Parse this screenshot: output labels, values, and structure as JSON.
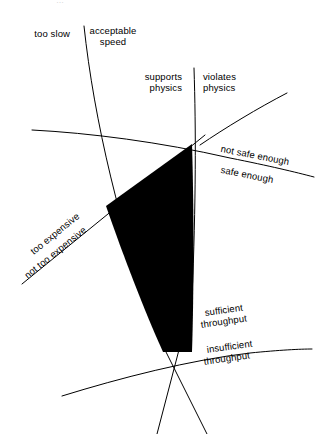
{
  "figure": {
    "kind": "constraint-boundary-diagram",
    "background_color": "#ffffff",
    "line_color": "#000000",
    "region_fill_color": "#000000",
    "top_fragment_text": "…"
  },
  "labels": {
    "too_slow": "too slow",
    "acceptable_speed_line1": "acceptable",
    "acceptable_speed_line2": "speed",
    "supports_physics_line1": "supports",
    "supports_physics_line2": "physics",
    "violates_physics_line1": "violates",
    "violates_physics_line2": "physics",
    "not_safe_enough": "not safe enough",
    "safe_enough": "safe enough",
    "too_expensive": "too expensive",
    "not_too_expensive": "not too expensive",
    "sufficient_throughput_line1": "sufficient",
    "sufficient_throughput_line2": "throughput",
    "insufficient_throughput_line1": "insufficient",
    "insufficient_throughput_line2": "throughput"
  },
  "boundaries": [
    {
      "id": "speed-boundary",
      "name": "speed-boundary-line",
      "left_side_label": "too slow",
      "right_side_label": "acceptable speed",
      "path": "M 84 26 C 94 120, 120 230, 160 340 L 207 434"
    },
    {
      "id": "physics-boundary",
      "name": "physics-boundary-line",
      "left_side_label": "supports physics",
      "right_side_label": "violates physics",
      "path": "M 194 68 C 196 130, 196 200, 192 300 L 157 434"
    },
    {
      "id": "safety-boundary",
      "name": "safety-boundary-curve",
      "upper_side_label": "not safe enough",
      "lower_side_label": "safe enough",
      "path": "M 32 130 C 90 133, 160 142, 230 158 C 270 166, 295 172, 314 177"
    },
    {
      "id": "cost-boundary",
      "name": "cost-boundary-line",
      "upper_side_label": "too expensive",
      "lower_side_label": "not too expensive",
      "path": "M 22 284 L 205 135"
    },
    {
      "id": "upper-right-curve",
      "name": "upper-right-boundary-curve",
      "path": "M 200 145 C 225 128, 258 108, 287 93"
    },
    {
      "id": "throughput-boundary",
      "name": "throughput-boundary-curve",
      "upper_side_label": "sufficient throughput",
      "lower_side_label": "insufficient throughput",
      "path": "M 62 396 C 120 378, 190 360, 250 353 C 280 350, 300 349, 312 349"
    }
  ],
  "region": {
    "name": "feasible-solution-region",
    "description": "black filled intersection region",
    "path": "M 192 144 L 106 206 C 124 258, 145 312, 163 352 L 192 352 C 194 290, 194 210, 192 144 Z"
  }
}
